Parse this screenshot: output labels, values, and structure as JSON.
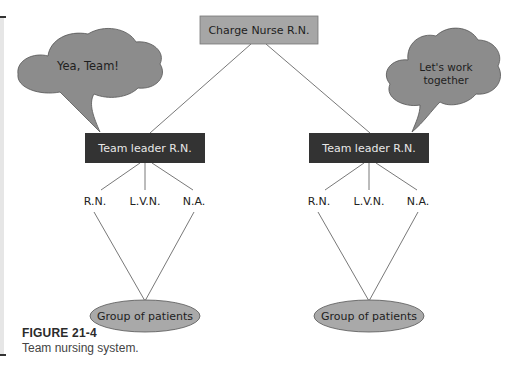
{
  "figure": {
    "label": "FIGURE 21-4",
    "caption": "Team nursing system."
  },
  "diagram": {
    "top_node": {
      "label": "Charge Nurse R.N.",
      "fill": "#a6a6a6"
    },
    "teams": [
      {
        "leader": {
          "label": "Team leader R.N.",
          "fill": "#333333",
          "text_color": "#e8e8e8"
        },
        "speech_bubble": {
          "text": "Yea, Team!",
          "fill": "#8c8c8c"
        },
        "members": [
          "R.N.",
          "L.V.N.",
          "N.A."
        ],
        "patients": {
          "label": "Group of patients",
          "fill": "#a9a9a9"
        }
      },
      {
        "leader": {
          "label": "Team leader R.N.",
          "fill": "#333333",
          "text_color": "#e8e8e8"
        },
        "speech_bubble": {
          "text_line1": "Let's work",
          "text_line2": "together",
          "fill": "#8c8c8c"
        },
        "members": [
          "R.N.",
          "L.V.N.",
          "N.A."
        ],
        "patients": {
          "label": "Group of patients",
          "fill": "#a9a9a9"
        }
      }
    ]
  }
}
